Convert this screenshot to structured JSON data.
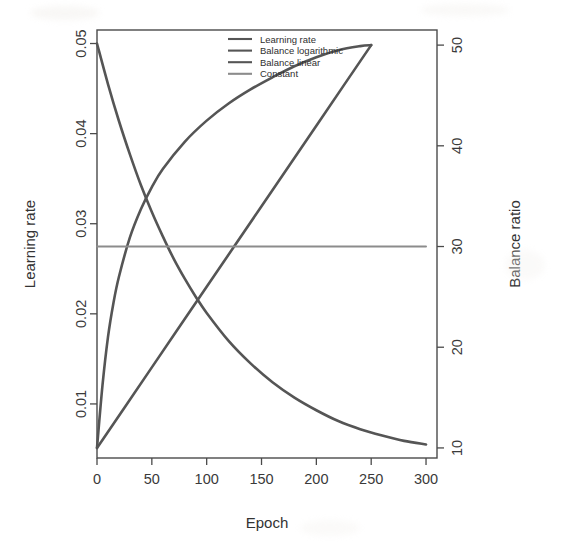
{
  "chart_data": {
    "type": "line",
    "title": "",
    "subtitle": "",
    "xlabel": "Epoch",
    "ylabel": "Learning rate",
    "y2label": "Balance ratio",
    "xlim": [
      0,
      310
    ],
    "ylim": [
      0.004,
      0.0515
    ],
    "y2lim": [
      9,
      51.5
    ],
    "xticks": [
      0,
      50,
      100,
      150,
      200,
      250,
      300
    ],
    "xtick_labels": [
      "0",
      "50",
      "100",
      "150",
      "200",
      "250",
      "300"
    ],
    "yticks": [
      0.01,
      0.02,
      0.03,
      0.04,
      0.05
    ],
    "ytick_labels": [
      "0.01",
      "0.02",
      "0.03",
      "0.04",
      "0.05"
    ],
    "y2ticks": [
      10,
      20,
      30,
      40,
      50
    ],
    "y2tick_labels": [
      "10",
      "20",
      "30",
      "40",
      "50"
    ],
    "grid": false,
    "legend_position": "top-center",
    "series": [
      {
        "name": "Learning rate",
        "axis": "left",
        "color": "#555555",
        "linewidth": 2.6,
        "x": [
          0,
          10,
          20,
          30,
          40,
          50,
          60,
          70,
          80,
          90,
          100,
          120,
          140,
          160,
          180,
          200,
          220,
          240,
          260,
          280,
          300
        ],
        "y": [
          0.05,
          0.0455,
          0.0414,
          0.0377,
          0.0343,
          0.0313,
          0.0286,
          0.0261,
          0.0239,
          0.0219,
          0.0201,
          0.017,
          0.0145,
          0.0124,
          0.0107,
          0.0093,
          0.0081,
          0.0072,
          0.0065,
          0.0059,
          0.0055
        ]
      },
      {
        "name": "Balance logarithmic",
        "axis": "right",
        "color": "#555555",
        "linewidth": 2.6,
        "x": [
          0,
          5,
          10,
          15,
          20,
          30,
          40,
          50,
          60,
          80,
          100,
          120,
          140,
          160,
          180,
          200,
          220,
          240,
          250
        ],
        "y": [
          10.0,
          16.2,
          21.0,
          24.4,
          27.0,
          30.9,
          33.7,
          35.9,
          37.7,
          40.4,
          42.5,
          44.2,
          45.6,
          46.8,
          47.9,
          48.8,
          49.5,
          49.9,
          50.0
        ]
      },
      {
        "name": "Balance linear",
        "axis": "right",
        "color": "#555555",
        "linewidth": 2.6,
        "x": [
          0,
          25,
          50,
          75,
          100,
          125,
          150,
          175,
          200,
          225,
          250
        ],
        "y": [
          10.0,
          14.0,
          18.0,
          22.0,
          26.0,
          30.0,
          34.0,
          38.0,
          42.0,
          46.0,
          50.0
        ]
      },
      {
        "name": "Constant",
        "axis": "right",
        "color": "#8c8c8c",
        "linewidth": 1.9,
        "x": [
          0,
          300
        ],
        "y": [
          30.0,
          30.0
        ]
      }
    ],
    "legend": [
      {
        "label": "Learning rate",
        "color": "#555555"
      },
      {
        "label": "Balance logarithmic",
        "color": "#555555"
      },
      {
        "label": "Balance linear",
        "color": "#555555"
      },
      {
        "label": "Constant",
        "color": "#8c8c8c"
      }
    ]
  }
}
